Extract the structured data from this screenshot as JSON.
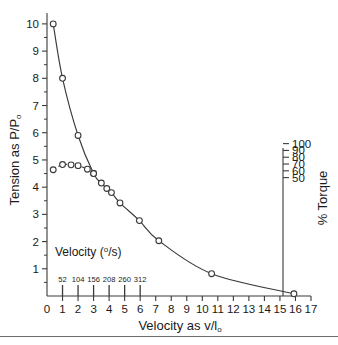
{
  "figure": {
    "background_color": "#ffffff",
    "line_color": "#3a3a3a",
    "marker_fill": "#ffffff",
    "bottom_rule_color": "#6e6e6e"
  },
  "axes": {
    "y_left": {
      "title_main": "Tension as P/P",
      "title_sub": "o",
      "ticks": [
        "1",
        "2",
        "3",
        "4",
        "5",
        "6",
        "7",
        "8",
        "9",
        "10"
      ],
      "range": [
        0,
        10.4
      ]
    },
    "y_right": {
      "title": "% Torque",
      "ticks": [
        "50",
        "60",
        "70",
        "80",
        "90",
        "100"
      ],
      "tick_y_values": [
        4.35,
        4.6,
        4.85,
        5.1,
        5.35,
        5.6
      ]
    },
    "x_bottom": {
      "title_main": "Velocity as v/l",
      "title_sub": "o",
      "ticks": [
        "0",
        "1",
        "2",
        "3",
        "4",
        "5",
        "6",
        "7",
        "8",
        "9",
        "10",
        "11",
        "12",
        "13",
        "14",
        "15",
        "16",
        "17"
      ],
      "range": [
        0,
        17
      ]
    },
    "x_inner": {
      "title_main": "Velocity (",
      "title_sup": "o",
      "title_tail": "/s)",
      "ticks": [
        "52",
        "104",
        "156",
        "208",
        "260",
        "312"
      ],
      "tick_x_values": [
        1,
        2,
        3,
        4,
        5,
        6
      ]
    }
  },
  "chart_data": {
    "type": "line",
    "title": "",
    "xlabel": "Velocity as v/lo",
    "ylabel": "Tension as P/Po",
    "xlim": [
      0,
      17
    ],
    "ylim": [
      0,
      10.4
    ],
    "grid": false,
    "legend": false,
    "secondary_y": {
      "label": "% Torque",
      "ticks": [
        50,
        60,
        70,
        80,
        90,
        100
      ]
    },
    "secondary_x": {
      "label": "Velocity (o/s)",
      "ticks": [
        52,
        104,
        156,
        208,
        260,
        312
      ],
      "maps_to_x": [
        1,
        2,
        3,
        4,
        5,
        6
      ]
    },
    "series": [
      {
        "name": "Tension (force-velocity)",
        "style": "solid",
        "marker": "open-circle",
        "x": [
          0.4,
          1.0,
          2.0,
          3.0,
          3.5,
          3.85,
          4.15,
          4.7,
          5.95,
          7.2,
          10.6,
          15.9
        ],
        "y": [
          10.0,
          8.0,
          5.9,
          4.5,
          4.15,
          3.95,
          3.8,
          3.42,
          2.77,
          2.03,
          0.82,
          0.08
        ]
      },
      {
        "name": "Torque (dashed segment)",
        "style": "dashed",
        "marker": "open-circle",
        "x": [
          0.4,
          1.0,
          1.55,
          2.0,
          2.6,
          3.0
        ],
        "y": [
          4.64,
          4.83,
          4.82,
          4.79,
          4.66,
          4.5
        ]
      }
    ]
  }
}
